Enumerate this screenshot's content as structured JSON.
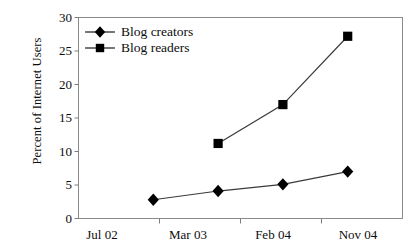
{
  "chart_data": {
    "type": "line",
    "title": "",
    "xlabel": "",
    "ylabel": "Percent of Internet Users",
    "categories": [
      "Jul 02",
      "Mar 03",
      "Feb 04",
      "Nov 04"
    ],
    "series": [
      {
        "name": "Blog creators",
        "marker": "diamond",
        "values": [
          2.8,
          4.1,
          5.1,
          7.0
        ]
      },
      {
        "name": "Blog readers",
        "marker": "square",
        "values": [
          null,
          11.2,
          17.0,
          27.2
        ]
      }
    ],
    "ylim": [
      0,
      30
    ],
    "yticks": [
      0,
      5,
      10,
      15,
      20,
      25,
      30
    ],
    "ytick_labels": [
      "0",
      "5",
      "10",
      "15",
      "20",
      "25",
      "30"
    ],
    "grid": false,
    "legend_position": "top-left-inside",
    "line_color": "#3a3a3a",
    "marker_color": "#000000",
    "axis_color": "#7d7d7d",
    "background": "#ffffff"
  },
  "legend": {
    "items": [
      {
        "label": "Blog creators",
        "icon": "diamond-marker-icon"
      },
      {
        "label": "Blog readers",
        "icon": "square-marker-icon"
      }
    ]
  },
  "axes": {
    "y_title": "Percent of Internet Users",
    "y_labels": [
      "30",
      "25",
      "20",
      "15",
      "10",
      "5",
      "0"
    ],
    "x_labels": [
      "Jul 02",
      "Mar 03",
      "Feb 04",
      "Nov 04"
    ]
  }
}
